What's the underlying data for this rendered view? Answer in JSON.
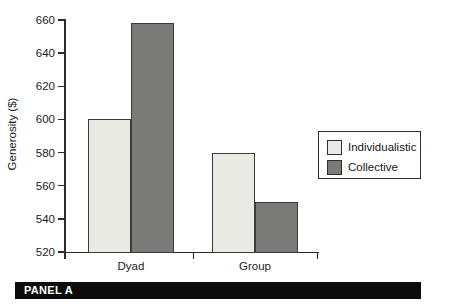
{
  "chart_data": {
    "type": "bar",
    "title": "",
    "xlabel": "",
    "ylabel": "Generosity ($)",
    "categories": [
      "Dyad",
      "Group"
    ],
    "series": [
      {
        "name": "Individualistic",
        "values": [
          600,
          580
        ],
        "color": "#eaeae5"
      },
      {
        "name": "Collective",
        "values": [
          658,
          550
        ],
        "color": "#7a7a78"
      }
    ],
    "ylim": [
      520,
      660
    ],
    "yticks": [
      520,
      540,
      560,
      580,
      600,
      620,
      640,
      660
    ],
    "grid": false,
    "legend_position": "center-right",
    "bar_border_color": "#3b3b3b",
    "axis_color": "#2b2b2b"
  },
  "panel": {
    "label": "PANEL A",
    "bar_color": "#0c0c0c",
    "text_color": "#ffffff"
  }
}
